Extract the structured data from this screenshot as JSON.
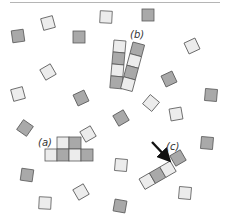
{
  "diagram": {
    "colors": {
      "light": "#ececec",
      "gray": "#a9a9a9",
      "stroke": "#5a5a5a",
      "arrow": "#111111"
    },
    "labels": {
      "a": "(a)",
      "b": "(b)",
      "c": "(c)"
    },
    "loose_squares": [
      {
        "x": 48,
        "y": 23,
        "shade": "light",
        "rot": -15
      },
      {
        "x": 18,
        "y": 36,
        "shade": "gray",
        "rot": -8
      },
      {
        "x": 79,
        "y": 37,
        "shade": "gray",
        "rot": 0
      },
      {
        "x": 106,
        "y": 17,
        "shade": "light",
        "rot": 3
      },
      {
        "x": 148,
        "y": 15,
        "shade": "gray",
        "rot": 0
      },
      {
        "x": 192,
        "y": 46,
        "shade": "light",
        "rot": -25
      },
      {
        "x": 48,
        "y": 72,
        "shade": "light",
        "rot": -30
      },
      {
        "x": 18,
        "y": 94,
        "shade": "light",
        "rot": -15
      },
      {
        "x": 81,
        "y": 98,
        "shade": "gray",
        "rot": -25
      },
      {
        "x": 169,
        "y": 79,
        "shade": "gray",
        "rot": -25
      },
      {
        "x": 211,
        "y": 95,
        "shade": "gray",
        "rot": 5
      },
      {
        "x": 151,
        "y": 103,
        "shade": "light",
        "rot": 40
      },
      {
        "x": 176,
        "y": 114,
        "shade": "light",
        "rot": -10
      },
      {
        "x": 121,
        "y": 118,
        "shade": "gray",
        "rot": -30
      },
      {
        "x": 25,
        "y": 128,
        "shade": "gray",
        "rot": 35
      },
      {
        "x": 88,
        "y": 134,
        "shade": "light",
        "rot": -30
      },
      {
        "x": 207,
        "y": 143,
        "shade": "gray",
        "rot": 5
      },
      {
        "x": 27,
        "y": 175,
        "shade": "gray",
        "rot": 8
      },
      {
        "x": 121,
        "y": 165,
        "shade": "light",
        "rot": 5
      },
      {
        "x": 81,
        "y": 192,
        "shade": "light",
        "rot": -30
      },
      {
        "x": 45,
        "y": 203,
        "shade": "light",
        "rot": 3
      },
      {
        "x": 120,
        "y": 206,
        "shade": "gray",
        "rot": 10
      },
      {
        "x": 185,
        "y": 193,
        "shade": "light",
        "rot": 5
      }
    ],
    "structure_a": {
      "top_row": [
        "light",
        "gray"
      ],
      "bottom_row": [
        "light",
        "gray",
        "light",
        "gray"
      ]
    },
    "structure_b": {
      "left_column": [
        "light",
        "gray",
        "light",
        "gray"
      ],
      "right_column": [
        "gray",
        "light",
        "gray",
        "light"
      ]
    },
    "structure_c": {
      "chain": [
        "light",
        "gray",
        "light"
      ],
      "attaching_square": "gray"
    }
  }
}
